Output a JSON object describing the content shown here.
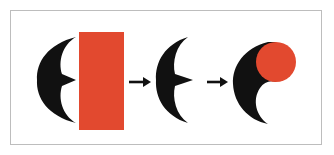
{
  "diagram": {
    "colors": {
      "shape_fill": "#111111",
      "accent_fill": "#e2492f",
      "frame_border": "#bdbdbd",
      "background": "#ffffff"
    },
    "steps": [
      {
        "id": "step-1",
        "shapes": [
          "black-crescent",
          "red-rectangle"
        ]
      },
      {
        "id": "step-2",
        "shapes": [
          "black-crescent"
        ]
      },
      {
        "id": "step-3",
        "shapes": [
          "black-crescent-tail",
          "red-circle"
        ]
      }
    ],
    "arrows": [
      {
        "from": "step-1",
        "to": "step-2",
        "icon": "right-arrow-icon"
      },
      {
        "from": "step-2",
        "to": "step-3",
        "icon": "right-arrow-icon"
      }
    ]
  }
}
